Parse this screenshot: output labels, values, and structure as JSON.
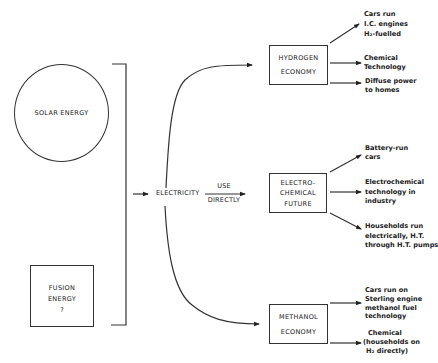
{
  "sources": {
    "solar": {
      "label": "SOLAR ENERGY"
    },
    "fusion": {
      "line1": "FUSION",
      "line2": "ENERGY",
      "line3": "?"
    }
  },
  "hub": {
    "label": "ELECTRICITY",
    "direct_label_top": "USE",
    "direct_label_bottom": "DIRECTLY"
  },
  "futures": [
    {
      "line1": "HYDROGEN",
      "line2": "ECONOMY",
      "outcomes": [
        [
          "Cars run",
          "I.C. engines",
          "H₂-fuelled"
        ],
        [
          "Chemical",
          "Technology"
        ],
        [
          "Diffuse power",
          "to homes"
        ]
      ]
    },
    {
      "line1": "ELECTRO-",
      "line2": "CHEMICAL",
      "line3": "FUTURE",
      "outcomes": [
        [
          "Battery-run",
          "cars"
        ],
        [
          "Electrochemical",
          "technology in",
          "industry"
        ],
        [
          "Households run",
          "electrically, H.T.",
          "through H.T. pumps"
        ]
      ]
    },
    {
      "line1": "METHANOL",
      "line2": "ECONOMY",
      "outcomes": [
        [
          "Cars run on",
          "Sterling engine",
          "methanol fuel",
          "technology"
        ],
        [
          "Chemical",
          "(households on",
          "H₂ directly)"
        ]
      ]
    }
  ]
}
